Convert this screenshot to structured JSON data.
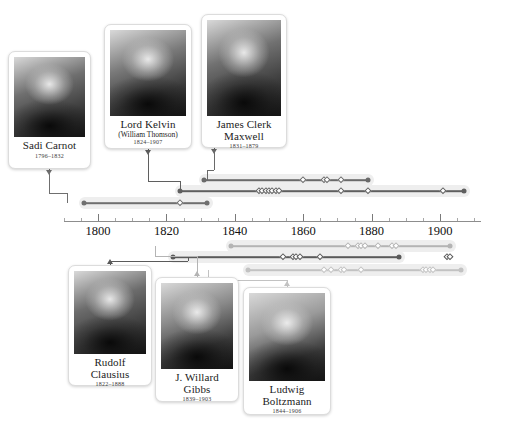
{
  "axis": {
    "start_year": 1790,
    "end_year": 1912,
    "major_ticks": [
      1800,
      1820,
      1840,
      1860,
      1880,
      1900
    ],
    "minor_step": 5,
    "labels": [
      "1800",
      "1820",
      "1840",
      "1860",
      "1880",
      "1900"
    ],
    "px_per_year": 3.42,
    "origin_px": 98,
    "origin_year": 1800,
    "line_color": "#8d8d8d",
    "label_color": "#111111"
  },
  "people": [
    {
      "id": "carnot",
      "name": "Sadi Carnot",
      "alt_name": "",
      "dates": "1796–1832",
      "birth": 1796,
      "death": 1832,
      "card": {
        "x": 8,
        "y": 51,
        "w": 83,
        "h": 118,
        "photo_h": 80
      },
      "photo_tone": "#6f6f6f",
      "track": {
        "y": 203,
        "color": "#6f6f6f",
        "row": "upper"
      },
      "events": [
        1824
      ],
      "connector": {
        "from_x": 49,
        "to_x": 67,
        "color": "#6f6f6f"
      }
    },
    {
      "id": "kelvin",
      "name": "Lord Kelvin",
      "alt_name": "(William Thomson)",
      "dates": "1824–1907",
      "birth": 1824,
      "death": 1907,
      "card": {
        "x": 104,
        "y": 24,
        "w": 88,
        "h": 125,
        "photo_h": 86
      },
      "photo_tone": "#7a7a7a",
      "track": {
        "y": 191,
        "color": "#5f5f5f",
        "row": "upper"
      },
      "events": [
        1847,
        1848,
        1849,
        1850,
        1851,
        1852,
        1853,
        1871,
        1879,
        1901
      ],
      "connector": {
        "from_x": 148,
        "to_x": 180,
        "color": "#5f5f5f"
      }
    },
    {
      "id": "maxwell",
      "name": "James Clerk",
      "alt_name": "Maxwell",
      "dates": "1831–1879",
      "birth": 1831,
      "death": 1879,
      "card": {
        "x": 201,
        "y": 14,
        "w": 86,
        "h": 134,
        "photo_h": 96
      },
      "photo_tone": "#717171",
      "track": {
        "y": 180,
        "color": "#6a6a6a",
        "row": "upper"
      },
      "events": [
        1860,
        1866,
        1867,
        1871
      ],
      "connector": {
        "from_x": 214,
        "to_x": 207,
        "color": "#6a6a6a"
      }
    },
    {
      "id": "clausius",
      "name": "Rudolf",
      "alt_name": "Clausius",
      "dates": "1822–1888",
      "birth": 1822,
      "death": 1888,
      "card": {
        "x": 68,
        "y": 265,
        "w": 84,
        "h": 121,
        "photo_h": 83
      },
      "photo_tone": "#6c6c6c",
      "track": {
        "y": 257,
        "color": "#5a5a5a",
        "row": "lower"
      },
      "events": [
        1854,
        1857,
        1858,
        1859,
        1865,
        1902,
        1903
      ],
      "connector": {
        "from_x": 110,
        "to_x": 188,
        "color": "#5a5a5a"
      }
    },
    {
      "id": "gibbs",
      "name": "J. Willard",
      "alt_name": "Gibbs",
      "dates": "1839–1903",
      "birth": 1839,
      "death": 1903,
      "card": {
        "x": 155,
        "y": 277,
        "w": 84,
        "h": 125,
        "photo_h": 86
      },
      "photo_tone": "#8a8a8a",
      "track": {
        "y": 246,
        "color": "#b4b4b4",
        "row": "lower"
      },
      "events": [
        1873,
        1876,
        1877,
        1878,
        1882,
        1886,
        1887
      ],
      "connector": {
        "from_x": 197,
        "to_x": 155,
        "color": "#b4b4b4"
      }
    },
    {
      "id": "boltzmann",
      "name": "Ludwig",
      "alt_name": "Boltzmann",
      "dates": "1844–1906",
      "birth": 1844,
      "death": 1906,
      "card": {
        "x": 243,
        "y": 287,
        "w": 88,
        "h": 128,
        "photo_h": 88
      },
      "photo_tone": "#9a9a9a",
      "track": {
        "y": 270,
        "color": "#c2c2c2",
        "row": "lower"
      },
      "events": [
        1866,
        1868,
        1871,
        1872,
        1877,
        1895,
        1896,
        1897,
        1898
      ],
      "connector": {
        "from_x": 287,
        "to_x": 208,
        "color": "#c2c2c2"
      }
    }
  ]
}
